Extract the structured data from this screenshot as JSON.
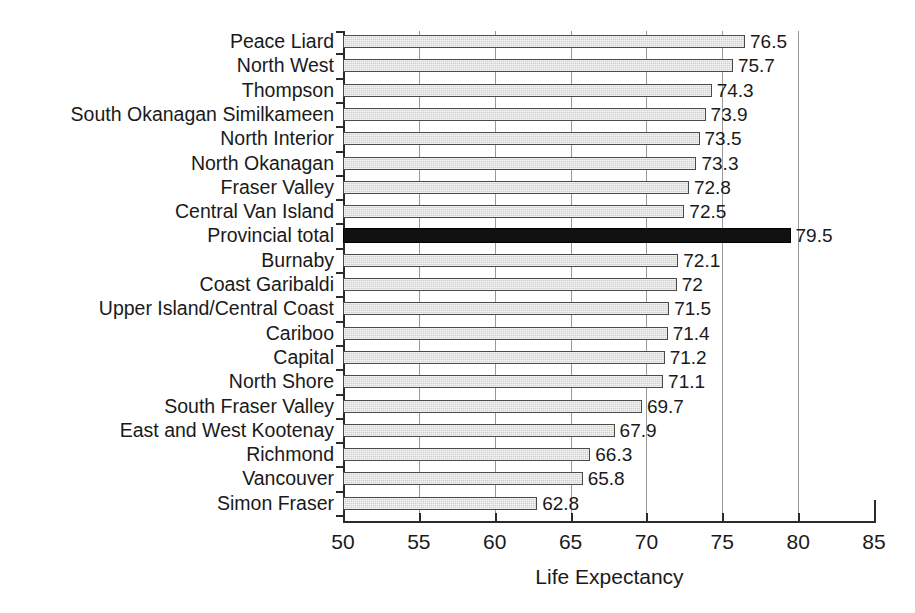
{
  "chart_data": {
    "type": "bar",
    "orientation": "horizontal",
    "title": "",
    "xlabel": "Life Expectancy",
    "ylabel": "",
    "xlim": [
      50,
      85
    ],
    "xticks": [
      50,
      55,
      60,
      65,
      70,
      75,
      80,
      85
    ],
    "gridlines": [
      55,
      60,
      65,
      70,
      75,
      80
    ],
    "grid": true,
    "legend": "none",
    "value_labels": true,
    "highlight_category": "Provincial total",
    "highlight_color": "#111111",
    "bar_color": "#d0d0d0",
    "bar_border_color": "#4a4a4a",
    "categories": [
      "Peace Liard",
      "North West",
      "Thompson",
      "South Okanagan Similkameen",
      "North Interior",
      "North Okanagan",
      "Fraser Valley",
      "Central Van Island",
      "Provincial total",
      "Burnaby",
      "Coast Garibaldi",
      "Upper Island/Central Coast",
      "Cariboo",
      "Capital",
      "North Shore",
      "South Fraser Valley",
      "East and West Kootenay",
      "Richmond",
      "Vancouver",
      "Simon Fraser"
    ],
    "values": [
      76.5,
      75.7,
      74.3,
      73.9,
      73.5,
      73.3,
      72.8,
      72.5,
      79.5,
      72.1,
      72,
      71.5,
      71.4,
      71.2,
      71.1,
      69.7,
      67.9,
      66.3,
      65.8,
      62.8
    ],
    "value_label_text": [
      "76.5",
      "75.7",
      "74.3",
      "73.9",
      "73.5",
      "73.3",
      "72.8",
      "72.5",
      "79.5",
      "72.1",
      "72",
      "71.5",
      "71.4",
      "71.2",
      "71.1",
      "69.7",
      "67.9",
      "66.3",
      "65.8",
      "62.8"
    ]
  }
}
